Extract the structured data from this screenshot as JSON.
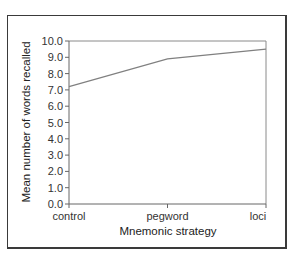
{
  "chart_data": {
    "type": "line",
    "title": "",
    "xlabel": "Mnemonic strategy",
    "ylabel": "Mean number of words recalled",
    "categories": [
      "control",
      "pegword",
      "loci"
    ],
    "series": [
      {
        "name": "Mean words recalled",
        "values": [
          7.2,
          8.9,
          9.5
        ],
        "color": "#808080"
      }
    ],
    "ylim": [
      0,
      10
    ],
    "yticks": [
      "0.0",
      "1.0",
      "2.0",
      "3.0",
      "4.0",
      "5.0",
      "6.0",
      "7.0",
      "8.0",
      "9.0",
      "10.0"
    ],
    "grid": false,
    "legend": "none",
    "plot_border": true
  }
}
